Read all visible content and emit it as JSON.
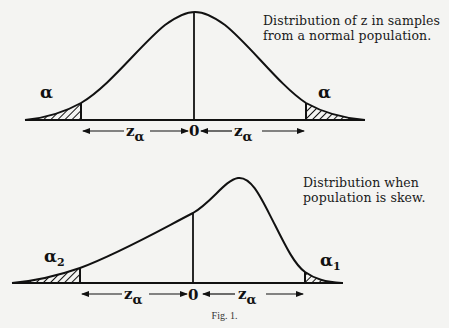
{
  "figure": {
    "label": "Fig. 1.",
    "top_panel": {
      "caption_line1": "Distribution of z in samples",
      "caption_line2": "from a normal population.",
      "left_tail_label": "α",
      "right_tail_label": "α",
      "left_interval_label": "z",
      "left_interval_subscript": "α",
      "right_interval_label": "z",
      "right_interval_subscript": "α",
      "origin_label": "0"
    },
    "bottom_panel": {
      "caption_line1": "Distribution when",
      "caption_line2": "population is skew.",
      "left_tail_label": "α",
      "left_tail_subscript": "2",
      "right_tail_label": "α",
      "right_tail_subscript": "1",
      "left_interval_label": "z",
      "left_interval_subscript": "α",
      "right_interval_label": "z",
      "right_interval_subscript": "α",
      "origin_label": "0"
    }
  },
  "colors": {
    "background": "#f4f4f2",
    "ink": "#111111"
  }
}
